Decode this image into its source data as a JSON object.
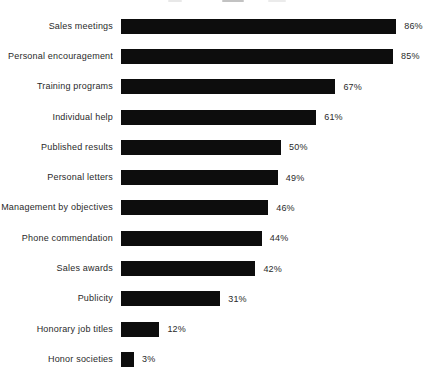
{
  "chart_data": {
    "type": "bar",
    "orientation": "horizontal",
    "title": "",
    "xlabel": "",
    "ylabel": "",
    "xlim": [
      0,
      100
    ],
    "grid": false,
    "legend": false,
    "value_labels": true,
    "value_suffix": "%",
    "bar_color": "#0d0d0d",
    "text_color": "#2a2a2a",
    "background_color": "#ffffff",
    "categories": [
      "Sales meetings",
      "Personal encouragement",
      "Training programs",
      "Individual help",
      "Published results",
      "Personal letters",
      "Management by objectives",
      "Phone commendation",
      "Sales awards",
      "Publicity",
      "Honorary job titles",
      "Honor societies"
    ],
    "values": [
      86,
      85,
      67,
      61,
      50,
      49,
      46,
      44,
      42,
      31,
      12,
      3
    ]
  }
}
